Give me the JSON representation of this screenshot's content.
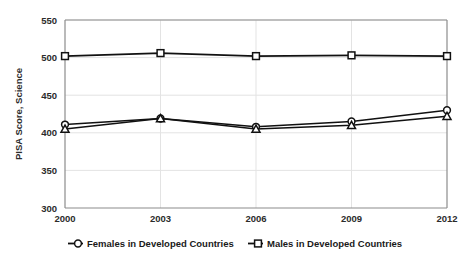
{
  "chart_data": {
    "type": "line",
    "title": "",
    "xlabel": "",
    "ylabel": "PISA Score, Science",
    "categories": [
      "2000",
      "2003",
      "2006",
      "2009",
      "2012"
    ],
    "x": [
      2000,
      2003,
      2006,
      2009,
      2012
    ],
    "ylim": [
      300,
      550
    ],
    "yticks": [
      300,
      350,
      400,
      450,
      500,
      550
    ],
    "grid": true,
    "legend_position": "bottom",
    "series": [
      {
        "name": "Females in Developed Countries",
        "marker": "circle",
        "values": [
          411,
          419,
          408,
          415,
          430
        ]
      },
      {
        "name": "Males in Developed Countries",
        "marker": "square",
        "values": [
          502,
          506,
          502,
          503,
          502
        ]
      },
      {
        "name": "Females in Developed Countries",
        "marker": "triangle",
        "values": [
          405,
          419,
          405,
          410,
          422
        ]
      }
    ]
  },
  "axes": {
    "y_title": "PISA Score, Science",
    "y_tick_labels": [
      "550",
      "500",
      "450",
      "400",
      "350",
      "300"
    ],
    "x_tick_labels": [
      "2000",
      "2003",
      "2006",
      "2009",
      "2012"
    ]
  },
  "legend": {
    "items": [
      {
        "label": "Females in Developed Countries",
        "marker": "circle-marker-icon"
      },
      {
        "label": "Males in Developed Countries",
        "marker": "square-marker-icon"
      }
    ]
  },
  "colors": {
    "line": "#111111",
    "marker_fill": "#ffffff",
    "grid": "#e3e3e3",
    "axis": "#8c8c8c",
    "text": "#2b2b2b",
    "background": "#ffffff"
  }
}
